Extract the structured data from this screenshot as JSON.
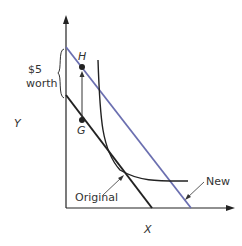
{
  "diagram": {
    "axes": {
      "y_label": "Y",
      "x_label": "X"
    },
    "points": {
      "H": "H",
      "G": "G"
    },
    "brace_label": [
      "$5",
      "worth"
    ],
    "lines": {
      "original": "Original",
      "new": "New"
    },
    "colors": {
      "new_line": "#6b6fb0",
      "ink": "#222222"
    }
  }
}
